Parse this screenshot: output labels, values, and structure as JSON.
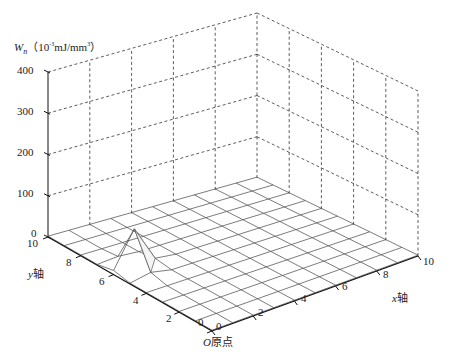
{
  "chart_data": {
    "type": "surface3d",
    "title": "",
    "zlabel": {
      "symbol": "W",
      "subscript": "n",
      "unit_prefix": "（10",
      "unit_exp": "-3",
      "unit_rest": "mJ/mm",
      "unit_exp2": "3",
      "unit_close": "）"
    },
    "xlabel": {
      "var": "x",
      "text": "轴"
    },
    "ylabel": {
      "var": "y",
      "text": "轴"
    },
    "origin_label": {
      "var": "O",
      "text": "原点"
    },
    "x_ticks": [
      0,
      2,
      4,
      6,
      8,
      10
    ],
    "y_ticks": [
      0,
      2,
      4,
      6,
      8,
      10
    ],
    "z_ticks": [
      0,
      100,
      200,
      300,
      400
    ],
    "xlim": [
      0,
      10
    ],
    "ylim": [
      0,
      10
    ],
    "zlim": [
      0,
      400
    ],
    "grid": true,
    "grid_resolution": 1,
    "surface": {
      "description": "Near-zero flat surface with a single sharp spike near x=1, y=6",
      "peak": {
        "x": 1,
        "y": 6,
        "z": 95
      },
      "baseline_z": 2,
      "neighbors": [
        {
          "x": 1,
          "y": 5,
          "z": 12
        },
        {
          "x": 0,
          "y": 6,
          "z": 10
        },
        {
          "x": 2,
          "y": 6,
          "z": 8
        },
        {
          "x": 1,
          "y": 7,
          "z": 6
        }
      ]
    }
  },
  "labels": {
    "z_ticks": [
      "400",
      "300",
      "200",
      "100",
      "0"
    ],
    "y_ticks": [
      "10",
      "8",
      "6",
      "4",
      "2",
      "0"
    ],
    "x_ticks": [
      "0",
      "2",
      "4",
      "6",
      "8",
      "10"
    ],
    "zlabel_symbol": "W",
    "zlabel_sub": "n",
    "zlabel_unit_a": "（10",
    "zlabel_unit_exp": "-3",
    "zlabel_unit_b": "mJ/mm",
    "zlabel_unit_exp2": "3",
    "zlabel_unit_c": "）",
    "ylabel_var": "y",
    "ylabel_text": "轴",
    "xlabel_var": "x",
    "xlabel_text": "轴",
    "origin_var": "O",
    "origin_text": "原点"
  }
}
